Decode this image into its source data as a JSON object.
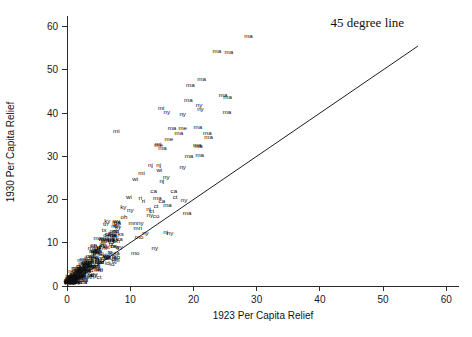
{
  "chart_data": {
    "type": "scatter",
    "title": "",
    "xlabel": "1923 Per Capita Relief",
    "ylabel": "1930 Per Capita Relief",
    "xlim": [
      0,
      62
    ],
    "ylim": [
      0,
      62
    ],
    "xticks": [
      0,
      10,
      20,
      30,
      40,
      50,
      60
    ],
    "yticks": [
      0,
      10,
      20,
      30,
      40,
      50,
      60
    ],
    "xticklabels": [
      "0",
      "10",
      "20",
      "30",
      "40",
      "50",
      "60"
    ],
    "yticklabels": [
      "0",
      "10",
      "20",
      "30",
      "40",
      "50",
      "60"
    ],
    "grid": false,
    "legend_position": "top-right",
    "annotations": [
      {
        "name": "reference-line-label",
        "text": "45 degree line",
        "x": 47.5,
        "y": 60.0
      }
    ],
    "reference_line": {
      "name": "45-degree-line",
      "label": "45 degree line",
      "slope": 1,
      "intercept": 0,
      "x_start": 0,
      "y_start": 0,
      "x_end": 55.5,
      "y_end": 55.5,
      "color": "#1e1e1e"
    },
    "point_label_type": "state-abbreviation",
    "marker": "text",
    "points": [
      {
        "label": "ma",
        "x": 28.7,
        "y": 57.4
      },
      {
        "label": "ma",
        "x": 25.6,
        "y": 53.6
      },
      {
        "label": "ma",
        "x": 23.7,
        "y": 53.9
      },
      {
        "label": "ma",
        "x": 21.3,
        "y": 47.4
      },
      {
        "label": "ma",
        "x": 19.5,
        "y": 46.0
      },
      {
        "label": "ma",
        "x": 24.7,
        "y": 43.8
      },
      {
        "label": "ma",
        "x": 25.4,
        "y": 43.2
      },
      {
        "label": "ma",
        "x": 19.2,
        "y": 42.6
      },
      {
        "label": "mi",
        "x": 14.9,
        "y": 40.8
      },
      {
        "label": "ny",
        "x": 15.8,
        "y": 39.9
      },
      {
        "label": "ny",
        "x": 20.9,
        "y": 41.3
      },
      {
        "label": "ny",
        "x": 21.1,
        "y": 40.5
      },
      {
        "label": "ny",
        "x": 18.3,
        "y": 39.3
      },
      {
        "label": "ma",
        "x": 25.3,
        "y": 39.8
      },
      {
        "label": "mi",
        "x": 7.8,
        "y": 35.4
      },
      {
        "label": "ma",
        "x": 16.6,
        "y": 36.2
      },
      {
        "label": "me",
        "x": 18.3,
        "y": 36.2
      },
      {
        "label": "ma",
        "x": 20.7,
        "y": 36.3
      },
      {
        "label": "ma",
        "x": 17.7,
        "y": 35.0
      },
      {
        "label": "ma",
        "x": 22.2,
        "y": 35.0
      },
      {
        "label": "ma",
        "x": 22.4,
        "y": 33.9
      },
      {
        "label": "me",
        "x": 16.1,
        "y": 33.5
      },
      {
        "label": "me",
        "x": 14.5,
        "y": 32.2
      },
      {
        "label": "mi",
        "x": 14.4,
        "y": 32.4
      },
      {
        "label": "ma",
        "x": 20.6,
        "y": 32.2
      },
      {
        "label": "ma",
        "x": 20.8,
        "y": 32.0
      },
      {
        "label": "ma",
        "x": 15.1,
        "y": 31.4
      },
      {
        "label": "ma",
        "x": 19.3,
        "y": 29.6
      },
      {
        "label": "ma",
        "x": 21.0,
        "y": 29.9
      },
      {
        "label": "nj",
        "x": 13.2,
        "y": 27.5
      },
      {
        "label": "nj",
        "x": 14.5,
        "y": 27.6
      },
      {
        "label": "wi",
        "x": 14.6,
        "y": 26.3
      },
      {
        "label": "ny",
        "x": 18.3,
        "y": 27.0
      },
      {
        "label": "mi",
        "x": 11.8,
        "y": 25.6
      },
      {
        "label": "ny",
        "x": 15.7,
        "y": 24.7
      },
      {
        "label": "wi",
        "x": 10.8,
        "y": 24.4
      },
      {
        "label": "nj",
        "x": 15.0,
        "y": 23.8
      },
      {
        "label": "ca",
        "x": 13.7,
        "y": 21.5
      },
      {
        "label": "ca",
        "x": 16.9,
        "y": 21.5
      },
      {
        "label": "ct",
        "x": 17.1,
        "y": 20.1
      },
      {
        "label": "wi",
        "x": 9.8,
        "y": 20.2
      },
      {
        "label": "ri",
        "x": 11.6,
        "y": 19.8
      },
      {
        "label": "ri",
        "x": 12.1,
        "y": 19.2
      },
      {
        "label": "ma",
        "x": 14.3,
        "y": 19.8
      },
      {
        "label": "ca",
        "x": 15.0,
        "y": 19.2
      },
      {
        "label": "ny",
        "x": 18.5,
        "y": 19.4
      },
      {
        "label": "ky",
        "x": 8.9,
        "y": 17.9
      },
      {
        "label": "ny",
        "x": 10.0,
        "y": 17.1
      },
      {
        "label": "ct",
        "x": 14.1,
        "y": 18.1
      },
      {
        "label": "ma",
        "x": 15.9,
        "y": 18.2
      },
      {
        "label": "nj",
        "x": 12.9,
        "y": 17.3
      },
      {
        "label": "ct",
        "x": 13.4,
        "y": 17.0
      },
      {
        "label": "oh",
        "x": 9.0,
        "y": 15.4
      },
      {
        "label": "ny",
        "x": 13.1,
        "y": 16.0
      },
      {
        "label": "co",
        "x": 14.1,
        "y": 15.7
      },
      {
        "label": "ma",
        "x": 19.0,
        "y": 16.4
      },
      {
        "label": "mn",
        "x": 10.4,
        "y": 14.0
      },
      {
        "label": "ny",
        "x": 11.6,
        "y": 14.2
      },
      {
        "label": "mn",
        "x": 11.2,
        "y": 13.0
      },
      {
        "label": "ks",
        "x": 8.5,
        "y": 11.5
      },
      {
        "label": "ny",
        "x": 12.4,
        "y": 11.8
      },
      {
        "label": "pa",
        "x": 7.0,
        "y": 10.3
      },
      {
        "label": "mo",
        "x": 11.4,
        "y": 10.8
      },
      {
        "label": "nj",
        "x": 15.6,
        "y": 12.1
      },
      {
        "label": "ny",
        "x": 16.3,
        "y": 11.9
      },
      {
        "label": "ny",
        "x": 13.9,
        "y": 8.3
      },
      {
        "label": "mo",
        "x": 10.8,
        "y": 7.2
      },
      {
        "label": "la",
        "x": 3.6,
        "y": 2.1
      },
      {
        "label": "mo",
        "x": 5.0,
        "y": 3.3
      }
    ],
    "cluster_note": "dense overlapping cluster of state abbreviations near origin (0-8, 0-12)"
  },
  "axes": {
    "xlabel": "1923 Per Capita Relief",
    "ylabel": "1930 Per Capita Relief"
  },
  "legend": {
    "reference_line_label": "45 degree line"
  }
}
